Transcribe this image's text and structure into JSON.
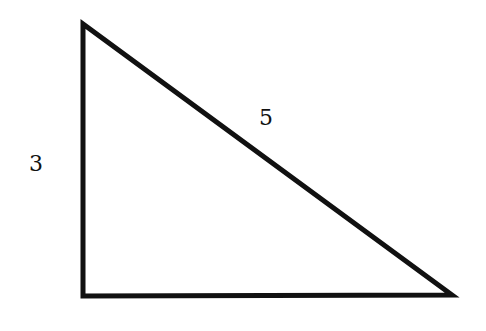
{
  "diagram": {
    "type": "right-triangle",
    "vertices": {
      "top": [
        83,
        24
      ],
      "right_angle": [
        83,
        296
      ],
      "right": [
        452,
        295
      ]
    },
    "stroke_color": "#111111",
    "stroke_width": 5,
    "labels": {
      "vertical_side": "3",
      "hypotenuse": "5"
    }
  }
}
